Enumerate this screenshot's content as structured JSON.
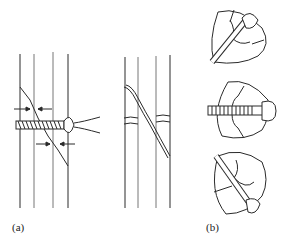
{
  "figure": {
    "panels": [
      {
        "id": "a",
        "label": "(a)",
        "description": "Lag screw fixation across an oblique fracture of a long bone, with arrows indicating compression, shown with screwdriver; second view shows healed fracture with screw hole"
      },
      {
        "id": "b",
        "label": "(b)",
        "description": "Three cross-sections of bone showing different screw orientations across the fracture"
      }
    ],
    "colors": {
      "line": "#2a2a2a",
      "background": "#ffffff"
    }
  }
}
